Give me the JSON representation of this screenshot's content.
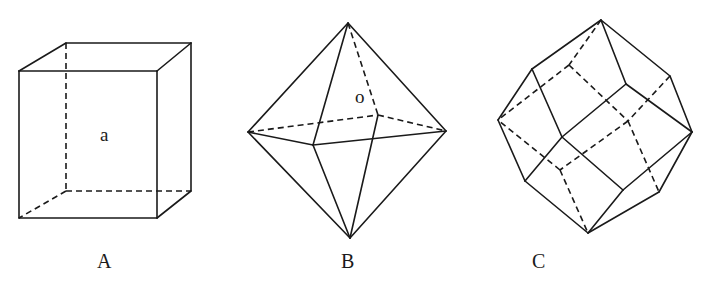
{
  "figure": {
    "cut_off_text_at_top": "",
    "stroke_color": "#1a1a1a",
    "background": "#ffffff",
    "solids": [
      {
        "id": "A",
        "name": "cube",
        "caption": "A",
        "caption_pos": [
          97,
          268
        ],
        "inner_label": "a",
        "inner_label_pos": [
          100,
          141
        ],
        "vertices": {
          "ftl": [
            19,
            71
          ],
          "ftr": [
            157,
            71
          ],
          "fbl": [
            19,
            218
          ],
          "fbr": [
            157,
            218
          ],
          "btl": [
            66,
            43
          ],
          "btr": [
            191,
            43
          ],
          "bbl": [
            66,
            191
          ],
          "bbr": [
            191,
            191
          ]
        },
        "solid_edges": [
          [
            "ftl",
            "ftr"
          ],
          [
            "ftr",
            "fbr"
          ],
          [
            "fbr",
            "fbl"
          ],
          [
            "fbl",
            "ftl"
          ],
          [
            "ftl",
            "btl"
          ],
          [
            "btl",
            "btr"
          ],
          [
            "ftr",
            "btr"
          ],
          [
            "btr",
            "bbr"
          ],
          [
            "fbr",
            "bbr"
          ]
        ],
        "hidden_edges": [
          [
            "btl",
            "bbl"
          ],
          [
            "bbl",
            "bbr"
          ],
          [
            "bbl",
            "fbl"
          ]
        ]
      },
      {
        "id": "B",
        "name": "octahedron",
        "caption": "B",
        "caption_pos": [
          341,
          268
        ],
        "inner_label": "o",
        "inner_label_pos": [
          355,
          103
        ],
        "vertices": {
          "top": [
            348,
            23
          ],
          "bottom": [
            350,
            238
          ],
          "left": [
            248,
            132
          ],
          "right": [
            446,
            131
          ],
          "front": [
            313,
            145
          ],
          "back": [
            378,
            115
          ]
        },
        "solid_edges": [
          [
            "top",
            "left"
          ],
          [
            "top",
            "right"
          ],
          [
            "top",
            "front"
          ],
          [
            "left",
            "front"
          ],
          [
            "front",
            "right"
          ],
          [
            "left",
            "bottom"
          ],
          [
            "right",
            "bottom"
          ],
          [
            "front",
            "bottom"
          ],
          [
            "back",
            "bottom"
          ]
        ],
        "hidden_edges": [
          [
            "top",
            "back"
          ],
          [
            "left",
            "back"
          ],
          [
            "back",
            "right"
          ]
        ]
      },
      {
        "id": "C",
        "name": "rhombic-dodecahedron",
        "caption": "C",
        "caption_pos": [
          532,
          268
        ],
        "inner_label": "",
        "vertices": {
          "T": [
            601,
            20
          ],
          "UL": [
            532,
            69
          ],
          "L": [
            498,
            120
          ],
          "LL": [
            525,
            181
          ],
          "B": [
            588,
            233
          ],
          "LR": [
            659,
            192
          ],
          "R": [
            692,
            132
          ],
          "UR": [
            670,
            76
          ],
          "FU": [
            626,
            84
          ],
          "C": [
            562,
            137
          ],
          "FLR": [
            623,
            190
          ],
          "H1": [
            569,
            65
          ],
          "HB": [
            628,
            121
          ],
          "HL": [
            560,
            170
          ]
        },
        "solid_edges": [
          [
            "T",
            "UL"
          ],
          [
            "UL",
            "L"
          ],
          [
            "L",
            "LL"
          ],
          [
            "LL",
            "B"
          ],
          [
            "B",
            "LR"
          ],
          [
            "LR",
            "R"
          ],
          [
            "R",
            "UR"
          ],
          [
            "UR",
            "T"
          ],
          [
            "T",
            "FU"
          ],
          [
            "FU",
            "R"
          ],
          [
            "UL",
            "C"
          ],
          [
            "C",
            "FU"
          ],
          [
            "LL",
            "C"
          ],
          [
            "C",
            "FLR"
          ],
          [
            "FLR",
            "R"
          ],
          [
            "FLR",
            "B"
          ]
        ],
        "hidden_edges": [
          [
            "T",
            "H1"
          ],
          [
            "H1",
            "L"
          ],
          [
            "H1",
            "HB"
          ],
          [
            "UR",
            "HB"
          ],
          [
            "HB",
            "LR"
          ],
          [
            "HB",
            "HL"
          ],
          [
            "HL",
            "L"
          ],
          [
            "HL",
            "B"
          ]
        ]
      }
    ]
  }
}
